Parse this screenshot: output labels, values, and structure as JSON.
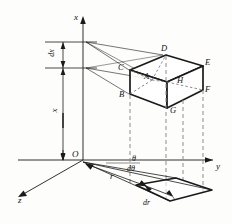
{
  "figure": {
    "stroke_color": "#1a1a1a",
    "dashed_color": "#8c8c8c",
    "background": "#fdfdfc"
  },
  "axes": {
    "x_label": "x",
    "y_label": "y",
    "z_label": "z",
    "origin_label": "O"
  },
  "dimensions": {
    "height_label": "x",
    "thickness_label": "dx",
    "radius_label": "r",
    "radial_increment_label": "dr",
    "angle_label": "θ",
    "angle_increment_label": "dθ"
  },
  "cube_vertices": [
    {
      "id": "A",
      "label": "A",
      "hidden": true,
      "x": 148,
      "y": 77
    },
    {
      "id": "B",
      "label": "B",
      "hidden": false,
      "x": 125,
      "y": 95
    },
    {
      "id": "C",
      "label": "C",
      "hidden": false,
      "x": 124,
      "y": 69
    },
    {
      "id": "D",
      "label": "D",
      "hidden": false,
      "x": 165,
      "y": 51
    },
    {
      "id": "E",
      "label": "E",
      "hidden": false,
      "x": 206,
      "y": 64
    },
    {
      "id": "F",
      "label": "F",
      "hidden": false,
      "x": 206,
      "y": 93
    },
    {
      "id": "G",
      "label": "G",
      "hidden": false,
      "x": 172,
      "y": 110
    },
    {
      "id": "H",
      "label": "H",
      "hidden": true,
      "x": 180,
      "y": 83
    }
  ]
}
